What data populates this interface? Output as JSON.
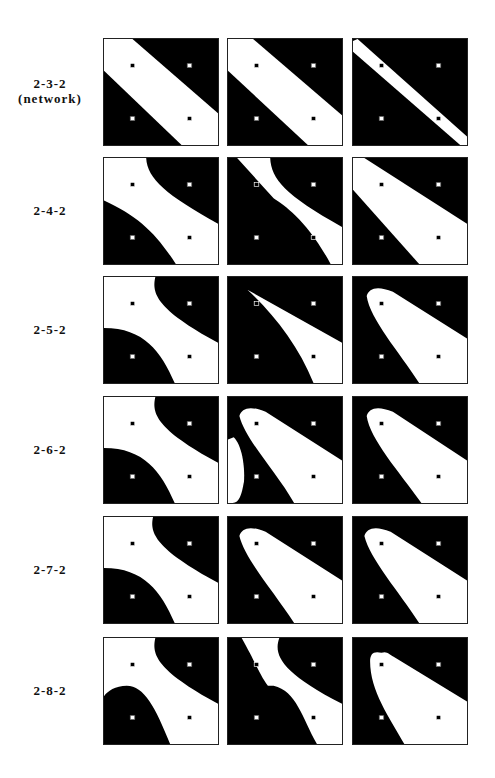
{
  "figure": {
    "colors": {
      "region_a": "#000000",
      "region_b": "#ffffff",
      "border": "#222222"
    },
    "markers": [
      {
        "pos": "top-left",
        "type": "filled-black-square"
      },
      {
        "pos": "top-right",
        "type": "hollow-white-square"
      },
      {
        "pos": "bottom-left",
        "type": "hollow-white-square"
      },
      {
        "pos": "bottom-right",
        "type": "filled-black-square"
      }
    ],
    "rows": [
      {
        "label": "2-3-2",
        "sublabel": "(network)"
      },
      {
        "label": "2-4-2",
        "sublabel": ""
      },
      {
        "label": "2-5-2",
        "sublabel": ""
      },
      {
        "label": "2-6-2",
        "sublabel": ""
      },
      {
        "label": "2-7-2",
        "sublabel": ""
      },
      {
        "label": "2-8-2",
        "sublabel": ""
      }
    ]
  }
}
